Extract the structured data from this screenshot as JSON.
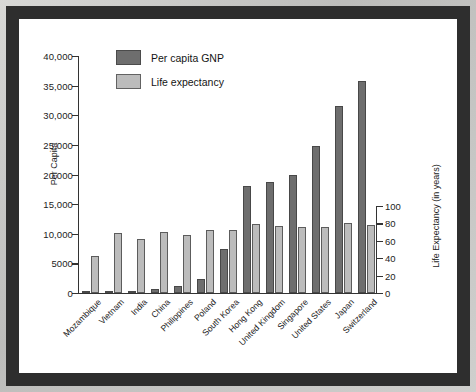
{
  "chart_data": {
    "type": "bar",
    "title": "",
    "ylabel": "Per Capita",
    "ylabel_right": "Life Expectancy (in years)",
    "xlabel": "",
    "ylim": [
      0,
      40000
    ],
    "ylim_right": [
      0,
      100
    ],
    "yticks": [
      "0",
      "5000",
      "10,000",
      "15,000",
      "20,000",
      "25,000",
      "30,000",
      "35,000",
      "40,000"
    ],
    "ytick_values": [
      0,
      5000,
      10000,
      15000,
      20000,
      25000,
      30000,
      35000,
      40000
    ],
    "yticks_right": [
      "0",
      "20",
      "40",
      "60",
      "80",
      "100"
    ],
    "ytick_values_right": [
      0,
      20,
      40,
      60,
      80,
      100
    ],
    "grid": false,
    "legend_position": "top-left",
    "categories": [
      "Mozambique",
      "Vietnam",
      "India",
      "China",
      "Philippines",
      "Poland",
      "South Korea",
      "Hong Kong",
      "United Kingdom",
      "Singapore",
      "United States",
      "Japan",
      "Switzerland"
    ],
    "series": [
      {
        "name": "Per capita GNP",
        "color": "#6e6e6e",
        "axis": "left",
        "values": [
          90,
          240,
          340,
          620,
          1200,
          2300,
          7500,
          18000,
          18700,
          20000,
          24800,
          31500,
          35800
        ]
      },
      {
        "name": "Life expectancy",
        "color": "#bcbcbc",
        "axis": "right",
        "values": [
          42,
          69,
          62,
          70,
          67,
          72,
          72,
          79,
          77,
          76,
          76,
          80,
          78
        ]
      }
    ]
  },
  "legend": {
    "items": [
      {
        "label": "Per capita GNP",
        "color": "#6e6e6e"
      },
      {
        "label": "Life expectancy",
        "color": "#bcbcbc"
      }
    ]
  }
}
